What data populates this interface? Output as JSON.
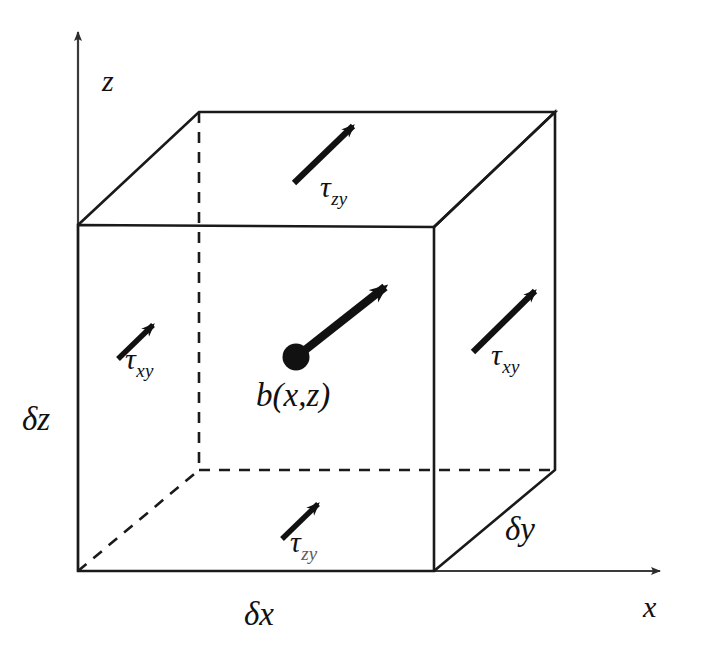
{
  "diagram": {
    "axes": [
      {
        "name": "z-axis",
        "label": "z",
        "direction": "up"
      },
      {
        "name": "x-axis",
        "label": "x",
        "direction": "right"
      }
    ],
    "dimensions": [
      {
        "name": "delta-z",
        "label": "δz",
        "edge": "left-vertical"
      },
      {
        "name": "delta-x",
        "label": "δx",
        "edge": "bottom-horizontal"
      },
      {
        "name": "delta-y",
        "label": "δy",
        "edge": "depth-diagonal"
      }
    ],
    "stress_arrows": [
      {
        "name": "tau-zy-top",
        "symbol": "τ",
        "subscript": "zy",
        "face": "top"
      },
      {
        "name": "tau-xy-left",
        "symbol": "τ",
        "subscript": "xy",
        "face": "left"
      },
      {
        "name": "tau-xy-right",
        "symbol": "τ",
        "subscript": "xy",
        "face": "right"
      },
      {
        "name": "tau-zy-bottom",
        "symbol": "τ",
        "subscript": "zy",
        "face": "bottom"
      }
    ],
    "body_force": {
      "name": "body-force-point",
      "label": "b(x,z)",
      "marker": "filled-dot"
    },
    "colors": {
      "stroke": "#1a1a1a",
      "axis": "#3a3a3a",
      "background": "#ffffff",
      "text": "#111111"
    }
  }
}
